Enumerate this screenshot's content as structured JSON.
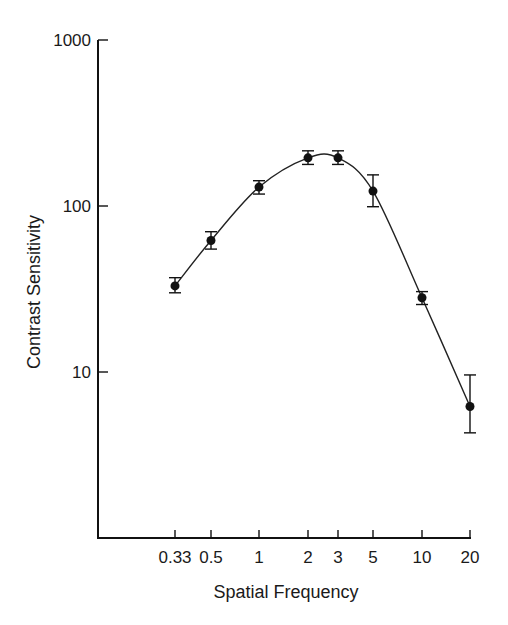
{
  "chart_data": {
    "type": "line",
    "title": "",
    "xlabel": "Spatial Frequency",
    "ylabel": "Contrast Sensitivity",
    "xscale": "log",
    "yscale": "log",
    "ylim": [
      1,
      1000
    ],
    "xlim": [
      0.33,
      20
    ],
    "grid": false,
    "legend": null,
    "x_ticks": [
      {
        "value": 0.33,
        "label": "0.33"
      },
      {
        "value": 0.5,
        "label": "0.5"
      },
      {
        "value": 1,
        "label": "1"
      },
      {
        "value": 2,
        "label": "2"
      },
      {
        "value": 3,
        "label": "3"
      },
      {
        "value": 5,
        "label": "5"
      },
      {
        "value": 10,
        "label": "10"
      },
      {
        "value": 20,
        "label": "20"
      }
    ],
    "y_ticks": [
      {
        "value": 10,
        "label": "10"
      },
      {
        "value": 100,
        "label": "100"
      },
      {
        "value": 1000,
        "label": "1000"
      }
    ],
    "series": [
      {
        "name": "Contrast sensitivity",
        "marker": "filled-circle",
        "color": "#111111",
        "x": [
          0.33,
          0.5,
          1,
          2,
          3,
          5,
          10,
          20
        ],
        "values": [
          33,
          62,
          130,
          195,
          195,
          123,
          28,
          6.2
        ],
        "error_low": [
          30,
          55,
          118,
          178,
          178,
          99,
          25.5,
          4.3
        ],
        "error_high": [
          37,
          70,
          142,
          215,
          215,
          154,
          30.5,
          9.6
        ]
      }
    ],
    "fit_curve": "smooth fitted curve through points"
  },
  "labels": {
    "xlabel": "Spatial Frequency",
    "ylabel": "Contrast Sensitivity"
  }
}
